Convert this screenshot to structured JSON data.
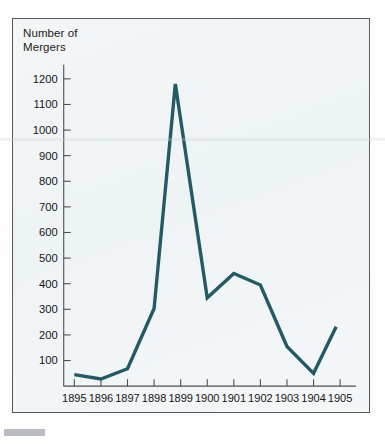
{
  "figure": {
    "background_color": "#fdfdfd",
    "panel_color": "#f1f5f7",
    "frame_color": "#55585c",
    "footer_marker": ""
  },
  "chart_data": {
    "type": "line",
    "title": "",
    "ylabel": "Number of\nMergers",
    "ylabel_line1": "Number of",
    "ylabel_line2": "Mergers",
    "xlabel": "",
    "series_color": "#235a64",
    "grid": false,
    "legend": null,
    "xlim": [
      1894.6,
      1905.6
    ],
    "ylim": [
      0,
      1255
    ],
    "ytick_labels": [
      "100",
      "200",
      "300",
      "400",
      "500",
      "600",
      "700",
      "800",
      "900",
      "1000",
      "1100",
      "1200"
    ],
    "yticks": [
      100,
      200,
      300,
      400,
      500,
      600,
      700,
      800,
      900,
      1000,
      1100,
      1200
    ],
    "xtick_labels": [
      "1895",
      "1896",
      "1897",
      "1898",
      "1899",
      "1900",
      "1901",
      "1902",
      "1903",
      "1904",
      "1905"
    ],
    "categories": [
      1895,
      1896,
      1897,
      1898,
      1899,
      1900,
      1901,
      1902,
      1903,
      1904,
      1905
    ],
    "x": [
      1895,
      1896,
      1897,
      1898,
      1898.8,
      1900,
      1901,
      1902,
      1903,
      1904,
      1904.85
    ],
    "values": [
      45,
      28,
      68,
      303,
      1180,
      345,
      440,
      395,
      155,
      50,
      232
    ]
  }
}
